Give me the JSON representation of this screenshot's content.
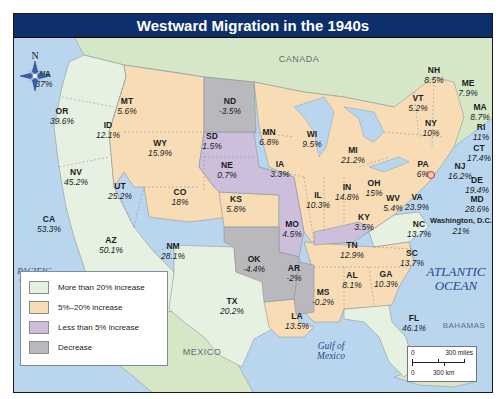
{
  "title": "Westward Migration in the 1940s",
  "colors": {
    "title_bg": "#0d2f6b",
    "water": "#b9d6ee",
    "foreign_land": "#d6e7c8",
    "more_than_20": "#e6f1e2",
    "five_to_20": "#f7dcb6",
    "less_than_5": "#cdbfdc",
    "decrease": "#b9b9bd"
  },
  "compass": {
    "label": "N"
  },
  "geo_labels": {
    "canada": "CANADA",
    "mexico": "MEXICO",
    "bahamas": "BAHAMAS"
  },
  "oceans": {
    "pacific_line1": "PACIFIC",
    "pacific_line2": "OCEAN",
    "atlantic_line1": "ATLANTIC",
    "atlantic_line2": "OCEAN",
    "gulf_line1": "Gulf of",
    "gulf_line2": "Mexico"
  },
  "legend": {
    "items": [
      {
        "label": "More than 20% increase",
        "color": "#e6f1e2"
      },
      {
        "label": "5%–20% increase",
        "color": "#f7dcb6"
      },
      {
        "label": "Less than 5% increase",
        "color": "#cdbfdc"
      },
      {
        "label": "Decrease",
        "color": "#b9b9bd"
      }
    ]
  },
  "scale": {
    "miles_zero": "0",
    "miles_label": "300 miles",
    "km_zero": "0",
    "km_label": "300 km"
  },
  "states": [
    {
      "abbr": "WA",
      "pct": "37%"
    },
    {
      "abbr": "OR",
      "pct": "39.6%"
    },
    {
      "abbr": "CA",
      "pct": "53.3%"
    },
    {
      "abbr": "NV",
      "pct": "45.2%"
    },
    {
      "abbr": "ID",
      "pct": "12.1%"
    },
    {
      "abbr": "MT",
      "pct": "5.6%"
    },
    {
      "abbr": "WY",
      "pct": "15.9%"
    },
    {
      "abbr": "UT",
      "pct": "25.2%"
    },
    {
      "abbr": "AZ",
      "pct": "50.1%"
    },
    {
      "abbr": "CO",
      "pct": "18%"
    },
    {
      "abbr": "NM",
      "pct": "28.1%"
    },
    {
      "abbr": "ND",
      "pct": "-3.5%"
    },
    {
      "abbr": "SD",
      "pct": "1.5%"
    },
    {
      "abbr": "NE",
      "pct": "0.7%"
    },
    {
      "abbr": "KS",
      "pct": "5.8%"
    },
    {
      "abbr": "OK",
      "pct": "-4.4%"
    },
    {
      "abbr": "TX",
      "pct": "20.2%"
    },
    {
      "abbr": "MN",
      "pct": "6.8%"
    },
    {
      "abbr": "IA",
      "pct": "3.3%"
    },
    {
      "abbr": "MO",
      "pct": "4.5%"
    },
    {
      "abbr": "AR",
      "pct": "-2%"
    },
    {
      "abbr": "LA",
      "pct": "13.5%"
    },
    {
      "abbr": "WI",
      "pct": "9.5%"
    },
    {
      "abbr": "IL",
      "pct": "10.3%"
    },
    {
      "abbr": "MS",
      "pct": "-0.2%"
    },
    {
      "abbr": "MI",
      "pct": "21.2%"
    },
    {
      "abbr": "IN",
      "pct": "14.8%"
    },
    {
      "abbr": "OH",
      "pct": "15%"
    },
    {
      "abbr": "KY",
      "pct": "3.5%"
    },
    {
      "abbr": "TN",
      "pct": "12.9%"
    },
    {
      "abbr": "AL",
      "pct": "8.1%"
    },
    {
      "abbr": "GA",
      "pct": "10.3%"
    },
    {
      "abbr": "FL",
      "pct": "46.1%"
    },
    {
      "abbr": "SC",
      "pct": "13.7%"
    },
    {
      "abbr": "NC",
      "pct": "13.7%"
    },
    {
      "abbr": "VA",
      "pct": "23.9%"
    },
    {
      "abbr": "WV",
      "pct": "5.4%"
    },
    {
      "abbr": "PA",
      "pct": "6%"
    },
    {
      "abbr": "NY",
      "pct": "10%"
    },
    {
      "abbr": "VT",
      "pct": "5.2%"
    },
    {
      "abbr": "NH",
      "pct": "8.5%"
    },
    {
      "abbr": "ME",
      "pct": "7.9%"
    },
    {
      "abbr": "MA",
      "pct": "8.7%"
    },
    {
      "abbr": "RI",
      "pct": "11%"
    },
    {
      "abbr": "CT",
      "pct": "17.4%"
    },
    {
      "abbr": "NJ",
      "pct": "16.2%"
    },
    {
      "abbr": "DE",
      "pct": "19.4%"
    },
    {
      "abbr": "MD",
      "pct": "28.6%"
    },
    {
      "abbr": "Washington, D.C.",
      "pct": "21%"
    }
  ]
}
